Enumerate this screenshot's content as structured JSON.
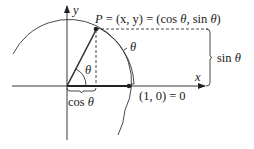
{
  "diagram": {
    "type": "unit-circle",
    "colors": {
      "stroke": "#333333",
      "background": "#ffffff"
    },
    "labels": {
      "y_axis": "y",
      "x_axis": "x",
      "point_p": "P = (x, y) = (cos θ, sin θ)",
      "point_p_P": "P",
      "point_p_rest": " = (x, y) = (cos ",
      "theta": "θ",
      "comma_sin": ", sin ",
      "close_paren": ")",
      "arc_theta": "θ",
      "angle_theta": "θ",
      "sin_label": "sin ",
      "sin_theta": "θ",
      "cos_label": "cos ",
      "cos_theta": "θ",
      "point_one_zero": "(1, 0) = 0"
    }
  }
}
